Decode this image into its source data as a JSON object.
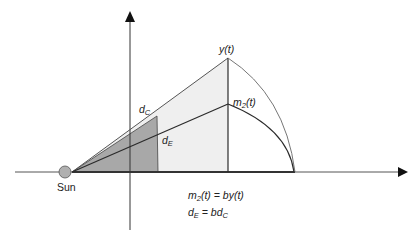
{
  "diagram": {
    "labels": {
      "sun": "Sun",
      "y_t": "y(t)",
      "m2_t": {
        "base": "m",
        "sub": "2",
        "rest": "(t)"
      },
      "d_c": {
        "base": "d",
        "sub": "C"
      },
      "d_e": {
        "base": "d",
        "sub": "E"
      }
    },
    "equations": {
      "line1": {
        "lhs_base": "m",
        "lhs_sub": "2",
        "lhs_rest": "(t) = by(t)"
      },
      "line2": {
        "lhs_base": "d",
        "lhs_sub": "E",
        "mid": " = bd",
        "rhs_sub": "C"
      }
    },
    "colors": {
      "axis": "#333333",
      "light_fill": "#efefef",
      "dark_fill": "#a8a8a8",
      "sun_fill": "#b0b0b0",
      "line": "#2a2a2a",
      "arc": "#777777"
    }
  }
}
